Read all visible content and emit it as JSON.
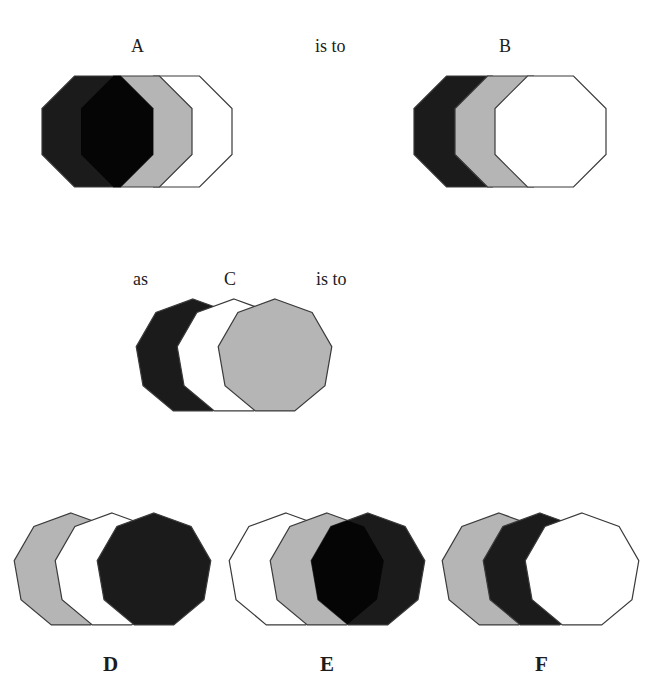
{
  "question": {
    "labels": [
      {
        "id": "label-a",
        "text": "A",
        "x": 131,
        "y": 37
      },
      {
        "id": "label-is-to-1",
        "text": "is to",
        "x": 315,
        "y": 37
      },
      {
        "id": "label-b",
        "text": "B",
        "x": 499,
        "y": 37
      },
      {
        "id": "label-as",
        "text": "as",
        "x": 133,
        "y": 270
      },
      {
        "id": "label-c",
        "text": "C",
        "x": 224,
        "y": 270
      },
      {
        "id": "label-is-to-2",
        "text": "is to",
        "x": 316,
        "y": 270
      }
    ],
    "option_labels": [
      {
        "id": "option-label-d",
        "text": "D",
        "x": 103,
        "y": 654
      },
      {
        "id": "option-label-e",
        "text": "E",
        "x": 320,
        "y": 654
      },
      {
        "id": "option-label-f",
        "text": "F",
        "x": 535,
        "y": 654
      }
    ]
  },
  "colors": {
    "black": "#1b1b1b",
    "deep_black": "#050505",
    "gray": "#b5b5b5",
    "white": "#ffffff",
    "stroke": "#3a3a3a"
  },
  "figures": [
    {
      "id": "figure-a",
      "shape": "octagon",
      "size": 111,
      "top": 76,
      "layers_back_to_front": [
        {
          "fill": "white",
          "left": 121
        },
        {
          "fill": "gray",
          "left": 81
        },
        {
          "fill": "black",
          "left": 42,
          "overlap_with_previous": "deep_black"
        }
      ]
    },
    {
      "id": "figure-b",
      "shape": "octagon",
      "size": 111,
      "top": 76,
      "layers_back_to_front": [
        {
          "fill": "black",
          "left": 414
        },
        {
          "fill": "gray",
          "left": 455
        },
        {
          "fill": "white",
          "left": 495
        }
      ]
    },
    {
      "id": "figure-c",
      "shape": "nonagon",
      "radius": 57.7,
      "top": 299,
      "layers_back_to_front": [
        {
          "fill": "black",
          "cx": 193
        },
        {
          "fill": "white",
          "cx": 234
        },
        {
          "fill": "gray",
          "cx": 275
        }
      ]
    },
    {
      "id": "option-d",
      "shape": "nonagon",
      "radius": 57.7,
      "top": 513,
      "layers_back_to_front": [
        {
          "fill": "gray",
          "cx": 71
        },
        {
          "fill": "white",
          "cx": 112
        },
        {
          "fill": "black",
          "cx": 154
        }
      ]
    },
    {
      "id": "option-e",
      "shape": "nonagon",
      "radius": 57.7,
      "top": 513,
      "layers_back_to_front": [
        {
          "fill": "white",
          "cx": 286
        },
        {
          "fill": "gray",
          "cx": 327
        },
        {
          "fill": "black",
          "cx": 368,
          "overlap_with_previous": "deep_black"
        }
      ]
    },
    {
      "id": "option-f",
      "shape": "nonagon",
      "radius": 57.7,
      "top": 513,
      "layers_back_to_front": [
        {
          "fill": "gray",
          "cx": 499
        },
        {
          "fill": "black",
          "cx": 540
        },
        {
          "fill": "white",
          "cx": 582
        }
      ]
    }
  ]
}
